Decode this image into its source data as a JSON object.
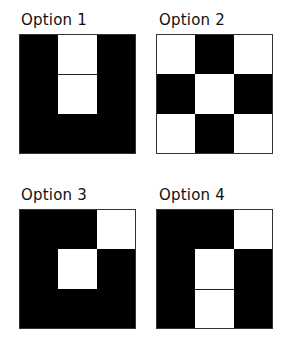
{
  "options": [
    {
      "label": "Option 1",
      "pattern": [
        "BWB",
        "BWB",
        "BBB"
      ]
    },
    {
      "label": "Option 2",
      "pattern": [
        "WBW",
        "BWB",
        "WBW"
      ]
    },
    {
      "label": "Option 3",
      "pattern": [
        "BBW",
        "BWB",
        "BBB"
      ]
    },
    {
      "label": "Option 4",
      "pattern": [
        "BBW",
        "BWB",
        "BWB"
      ]
    }
  ],
  "colors": {
    "filled": "#000000",
    "empty": "#ffffff"
  }
}
